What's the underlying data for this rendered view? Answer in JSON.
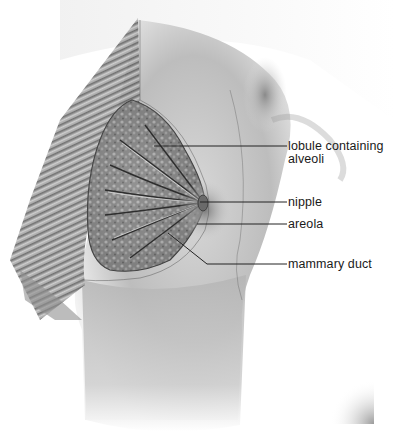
{
  "figure": {
    "labels": [
      {
        "id": "lobule",
        "text": "lobule containing",
        "text2": "alveoli"
      },
      {
        "id": "nipple",
        "text": "nipple"
      },
      {
        "id": "areola",
        "text": "areola"
      },
      {
        "id": "mammary_duct",
        "text": "mammary duct"
      }
    ],
    "colors": {
      "background": "#ffffff",
      "label_text": "#1a1a1a",
      "leader_line": "#222222",
      "skin_shade": "#9a9a9a",
      "tissue_dark": "#4a4a4a"
    }
  }
}
